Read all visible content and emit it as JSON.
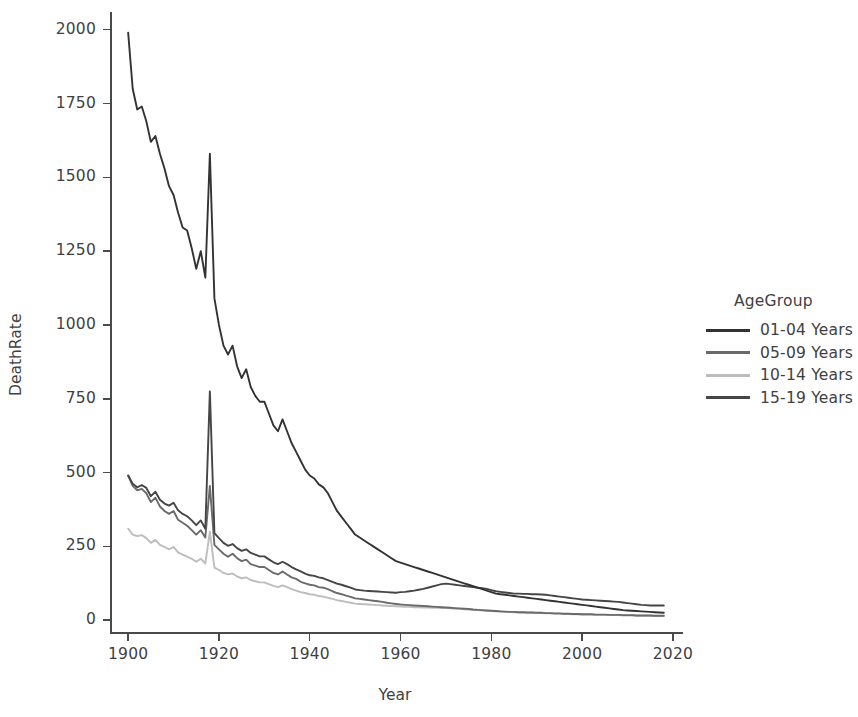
{
  "chart_data": {
    "type": "line",
    "title": "",
    "xlabel": "Year",
    "ylabel": "DeathRate",
    "xlim": [
      1896,
      2022
    ],
    "ylim": [
      -40,
      2060
    ],
    "xticks": [
      1900,
      1920,
      1940,
      1960,
      1980,
      2000,
      2020
    ],
    "yticks": [
      0,
      250,
      500,
      750,
      1000,
      1250,
      1500,
      1750,
      2000
    ],
    "grid": false,
    "legend_title": "AgeGroup",
    "legend_position": "right",
    "series": [
      {
        "name": "01-04 Years",
        "color": "#333333",
        "x": [
          1900,
          1901,
          1902,
          1903,
          1904,
          1905,
          1906,
          1907,
          1908,
          1909,
          1910,
          1911,
          1912,
          1913,
          1914,
          1915,
          1916,
          1917,
          1918,
          1919,
          1920,
          1921,
          1922,
          1923,
          1924,
          1925,
          1926,
          1927,
          1928,
          1929,
          1930,
          1931,
          1932,
          1933,
          1934,
          1935,
          1936,
          1937,
          1938,
          1939,
          1940,
          1941,
          1942,
          1943,
          1944,
          1945,
          1946,
          1947,
          1948,
          1949,
          1950,
          1951,
          1952,
          1953,
          1954,
          1955,
          1956,
          1957,
          1958,
          1959,
          1960,
          1961,
          1962,
          1963,
          1964,
          1965,
          1966,
          1967,
          1968,
          1969,
          1970,
          1971,
          1972,
          1973,
          1974,
          1975,
          1976,
          1977,
          1978,
          1979,
          1980,
          1981,
          1982,
          1983,
          1984,
          1985,
          1986,
          1987,
          1988,
          1989,
          1990,
          1991,
          1992,
          1993,
          1994,
          1995,
          1996,
          1997,
          1998,
          1999,
          2000,
          2001,
          2002,
          2003,
          2004,
          2005,
          2006,
          2007,
          2008,
          2009,
          2010,
          2011,
          2012,
          2013,
          2014,
          2015,
          2016,
          2017,
          2018
        ],
        "values": [
          1990,
          1800,
          1730,
          1740,
          1690,
          1620,
          1640,
          1580,
          1530,
          1470,
          1440,
          1380,
          1330,
          1320,
          1260,
          1190,
          1250,
          1160,
          1580,
          1090,
          1000,
          930,
          900,
          930,
          860,
          820,
          850,
          790,
          760,
          740,
          740,
          700,
          660,
          640,
          680,
          640,
          600,
          570,
          540,
          510,
          490,
          480,
          460,
          450,
          430,
          400,
          370,
          350,
          330,
          310,
          290,
          280,
          270,
          260,
          250,
          240,
          230,
          220,
          210,
          200,
          195,
          190,
          185,
          180,
          175,
          170,
          165,
          160,
          155,
          150,
          145,
          140,
          135,
          130,
          125,
          120,
          115,
          110,
          105,
          100,
          95,
          90,
          88,
          86,
          84,
          82,
          80,
          78,
          76,
          74,
          72,
          70,
          68,
          66,
          64,
          62,
          60,
          58,
          56,
          54,
          52,
          50,
          48,
          46,
          44,
          42,
          40,
          38,
          36,
          34,
          33,
          32,
          31,
          30,
          29,
          28,
          27,
          26,
          25
        ]
      },
      {
        "name": "05-09 Years",
        "color": "#6a6a6a",
        "x": [
          1900,
          1901,
          1902,
          1903,
          1904,
          1905,
          1906,
          1907,
          1908,
          1909,
          1910,
          1911,
          1912,
          1913,
          1914,
          1915,
          1916,
          1917,
          1918,
          1919,
          1920,
          1921,
          1922,
          1923,
          1924,
          1925,
          1926,
          1927,
          1928,
          1929,
          1930,
          1931,
          1932,
          1933,
          1934,
          1935,
          1936,
          1937,
          1938,
          1939,
          1940,
          1941,
          1942,
          1943,
          1944,
          1945,
          1946,
          1947,
          1948,
          1949,
          1950,
          1951,
          1952,
          1953,
          1954,
          1955,
          1956,
          1957,
          1958,
          1959,
          1960,
          1961,
          1962,
          1963,
          1964,
          1965,
          1966,
          1967,
          1968,
          1969,
          1970,
          1971,
          1972,
          1973,
          1974,
          1975,
          1976,
          1977,
          1978,
          1979,
          1980,
          1981,
          1982,
          1983,
          1984,
          1985,
          1986,
          1987,
          1988,
          1989,
          1990,
          1991,
          1992,
          1993,
          1994,
          1995,
          1996,
          1997,
          1998,
          1999,
          2000,
          2001,
          2002,
          2003,
          2004,
          2005,
          2006,
          2007,
          2008,
          2009,
          2010,
          2011,
          2012,
          2013,
          2014,
          2015,
          2016,
          2017,
          2018
        ],
        "values": [
          490,
          455,
          440,
          445,
          430,
          400,
          415,
          385,
          370,
          360,
          370,
          340,
          330,
          320,
          305,
          290,
          305,
          280,
          455,
          255,
          240,
          225,
          215,
          225,
          210,
          200,
          205,
          190,
          185,
          180,
          180,
          170,
          160,
          155,
          165,
          155,
          145,
          140,
          130,
          125,
          120,
          118,
          112,
          110,
          105,
          98,
          92,
          88,
          83,
          79,
          74,
          72,
          70,
          68,
          66,
          64,
          62,
          59,
          57,
          55,
          53,
          52,
          51,
          50,
          49,
          48,
          47,
          46,
          45,
          44,
          43,
          42,
          41,
          40,
          39,
          38,
          36,
          35,
          34,
          33,
          32,
          31,
          30,
          29,
          28,
          28,
          27,
          27,
          26,
          26,
          25,
          25,
          24,
          24,
          23,
          23,
          22,
          22,
          21,
          21,
          20,
          20,
          20,
          19,
          19,
          19,
          18,
          18,
          18,
          17,
          17,
          17,
          16,
          16,
          16,
          16,
          15,
          15,
          15
        ]
      },
      {
        "name": "10-14 Years",
        "color": "#bdbdbd",
        "x": [
          1900,
          1901,
          1902,
          1903,
          1904,
          1905,
          1906,
          1907,
          1908,
          1909,
          1910,
          1911,
          1912,
          1913,
          1914,
          1915,
          1916,
          1917,
          1918,
          1919,
          1920,
          1921,
          1922,
          1923,
          1924,
          1925,
          1926,
          1927,
          1928,
          1929,
          1930,
          1931,
          1932,
          1933,
          1934,
          1935,
          1936,
          1937,
          1938,
          1939,
          1940,
          1941,
          1942,
          1943,
          1944,
          1945,
          1946,
          1947,
          1948,
          1949,
          1950,
          1951,
          1952,
          1953,
          1954,
          1955,
          1956,
          1957,
          1958,
          1959,
          1960,
          1961,
          1962,
          1963,
          1964,
          1965,
          1966,
          1967,
          1968,
          1969,
          1970,
          1971,
          1972,
          1973,
          1974,
          1975,
          1976,
          1977,
          1978,
          1979,
          1980,
          1981,
          1982,
          1983,
          1984,
          1985,
          1986,
          1987,
          1988,
          1989,
          1990,
          1991,
          1992,
          1993,
          1994,
          1995,
          1996,
          1997,
          1998,
          1999,
          2000,
          2001,
          2002,
          2003,
          2004,
          2005,
          2006,
          2007,
          2008,
          2009,
          2010,
          2011,
          2012,
          2013,
          2014,
          2015,
          2016,
          2017,
          2018
        ],
        "values": [
          310,
          290,
          285,
          288,
          278,
          262,
          272,
          255,
          248,
          240,
          248,
          230,
          222,
          215,
          208,
          198,
          208,
          192,
          300,
          178,
          170,
          160,
          155,
          158,
          148,
          142,
          145,
          136,
          132,
          128,
          128,
          122,
          116,
          112,
          118,
          112,
          105,
          100,
          95,
          92,
          88,
          86,
          82,
          80,
          76,
          72,
          68,
          65,
          62,
          59,
          56,
          55,
          54,
          53,
          52,
          51,
          50,
          49,
          48,
          47,
          46,
          45,
          45,
          44,
          44,
          43,
          43,
          42,
          42,
          41,
          41,
          40,
          39,
          38,
          37,
          36,
          35,
          34,
          33,
          32,
          31,
          30,
          29,
          28,
          28,
          27,
          26,
          26,
          25,
          25,
          24,
          24,
          23,
          23,
          22,
          22,
          21,
          21,
          20,
          20,
          19,
          19,
          19,
          18,
          18,
          18,
          17,
          17,
          17,
          16,
          16,
          16,
          15,
          15,
          15,
          15,
          14,
          14,
          14
        ]
      },
      {
        "name": "15-19 Years",
        "color": "#454545",
        "x": [
          1900,
          1901,
          1902,
          1903,
          1904,
          1905,
          1906,
          1907,
          1908,
          1909,
          1910,
          1911,
          1912,
          1913,
          1914,
          1915,
          1916,
          1917,
          1918,
          1919,
          1920,
          1921,
          1922,
          1923,
          1924,
          1925,
          1926,
          1927,
          1928,
          1929,
          1930,
          1931,
          1932,
          1933,
          1934,
          1935,
          1936,
          1937,
          1938,
          1939,
          1940,
          1941,
          1942,
          1943,
          1944,
          1945,
          1946,
          1947,
          1948,
          1949,
          1950,
          1951,
          1952,
          1953,
          1954,
          1955,
          1956,
          1957,
          1958,
          1959,
          1960,
          1961,
          1962,
          1963,
          1964,
          1965,
          1966,
          1967,
          1968,
          1969,
          1970,
          1971,
          1972,
          1973,
          1974,
          1975,
          1976,
          1977,
          1978,
          1979,
          1980,
          1981,
          1982,
          1983,
          1984,
          1985,
          1986,
          1987,
          1988,
          1989,
          1990,
          1991,
          1992,
          1993,
          1994,
          1995,
          1996,
          1997,
          1998,
          1999,
          2000,
          2001,
          2002,
          2003,
          2004,
          2005,
          2006,
          2007,
          2008,
          2009,
          2010,
          2011,
          2012,
          2013,
          2014,
          2015,
          2016,
          2017,
          2018
        ],
        "values": [
          490,
          462,
          450,
          458,
          448,
          420,
          435,
          408,
          395,
          388,
          398,
          372,
          360,
          352,
          338,
          322,
          338,
          310,
          775,
          295,
          278,
          262,
          252,
          258,
          244,
          235,
          240,
          228,
          222,
          216,
          216,
          206,
          196,
          190,
          198,
          190,
          180,
          172,
          165,
          158,
          152,
          150,
          145,
          142,
          136,
          130,
          124,
          120,
          115,
          110,
          104,
          102,
          100,
          99,
          98,
          97,
          96,
          95,
          94,
          93,
          95,
          96,
          98,
          100,
          103,
          106,
          110,
          114,
          118,
          122,
          124,
          122,
          120,
          118,
          116,
          114,
          112,
          110,
          108,
          106,
          102,
          98,
          96,
          94,
          92,
          90,
          90,
          89,
          89,
          88,
          88,
          87,
          86,
          84,
          82,
          80,
          78,
          76,
          74,
          72,
          70,
          69,
          68,
          67,
          66,
          65,
          64,
          63,
          62,
          60,
          58,
          56,
          54,
          52,
          51,
          50,
          50,
          50,
          50
        ]
      }
    ]
  },
  "axes": {
    "xlabel": "Year",
    "ylabel": "DeathRate",
    "xticks": [
      "1900",
      "1920",
      "1940",
      "1960",
      "1980",
      "2000",
      "2020"
    ],
    "yticks": [
      "2000",
      "1750",
      "1500",
      "1250",
      "1000",
      "750",
      "500",
      "250",
      "0"
    ]
  },
  "legend": {
    "title": "AgeGroup",
    "entries": [
      {
        "label": "01-04 Years",
        "color": "#333333"
      },
      {
        "label": "05-09 Years",
        "color": "#6a6a6a"
      },
      {
        "label": "10-14 Years",
        "color": "#bdbdbd"
      },
      {
        "label": "15-19 Years",
        "color": "#454545"
      }
    ]
  }
}
